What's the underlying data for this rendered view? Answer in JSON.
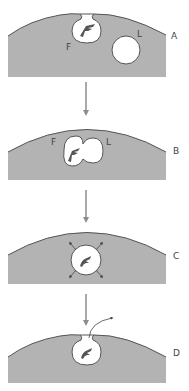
{
  "diagram": {
    "type": "process-sequence",
    "colors": {
      "cytoplasm": "#b3b3b3",
      "membrane": "#555555",
      "vesicle": "#ffffff",
      "particle": "#555555",
      "arrow": "#8c8c8c",
      "label": "#444444"
    },
    "panels": [
      {
        "id": "A",
        "label": "A",
        "vesicles": [
          {
            "label": "F",
            "description": "phagosome opening at membrane with particle"
          },
          {
            "label": "L",
            "description": "lysosome"
          }
        ]
      },
      {
        "id": "B",
        "label": "B",
        "vesicles": [
          {
            "label": "F",
            "description": "phagosome fusing"
          },
          {
            "label": "L",
            "description": "lysosome fusing"
          }
        ]
      },
      {
        "id": "C",
        "label": "C",
        "vesicles": [
          {
            "label": "",
            "description": "residual body with digestion arrows"
          }
        ]
      },
      {
        "id": "D",
        "label": "D",
        "vesicles": [
          {
            "label": "",
            "description": "exocytosis of residue through membrane"
          }
        ]
      }
    ],
    "labels": {
      "A": "A",
      "B": "B",
      "C": "C",
      "D": "D",
      "F_a": "F",
      "L_a": "L",
      "F_b": "F",
      "L_b": "L"
    }
  }
}
